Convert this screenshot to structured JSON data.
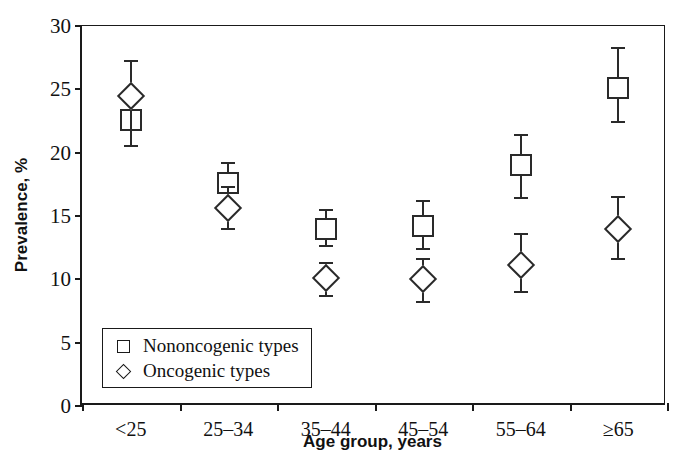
{
  "chart_data": {
    "type": "scatter",
    "title": "",
    "xlabel": "Age group, years",
    "ylabel": "Prevalence, %",
    "categories": [
      "<25",
      "25–34",
      "35–44",
      "45–54",
      "55–64",
      "≥65"
    ],
    "ylim": [
      0,
      30
    ],
    "yticks": [
      0,
      5,
      10,
      15,
      20,
      25,
      30
    ],
    "ytick_labels": [
      "0",
      "5",
      "10",
      "15",
      "20",
      "25",
      "30"
    ],
    "grid": false,
    "legend_position": "lower-left-inside",
    "series": [
      {
        "name": "Nononcogenic types",
        "marker": "open-square",
        "values": [
          22.6,
          17.6,
          14.0,
          14.2,
          19.0,
          25.1
        ],
        "ci_low": [
          20.5,
          16.1,
          12.6,
          12.4,
          16.4,
          22.4
        ],
        "ci_high": [
          27.2,
          19.2,
          15.5,
          16.2,
          21.4,
          28.3
        ]
      },
      {
        "name": "Oncogenic types",
        "marker": "open-diamond",
        "values": [
          24.5,
          15.6,
          10.1,
          10.0,
          11.1,
          14.0
        ],
        "ci_low": [
          20.5,
          14.0,
          8.7,
          8.2,
          9.0,
          11.6
        ],
        "ci_high": [
          27.2,
          17.3,
          11.3,
          11.6,
          13.6,
          16.5
        ]
      }
    ]
  },
  "legend": {
    "entries": [
      {
        "label": "Nononcogenic types",
        "marker": "open-square"
      },
      {
        "label": "Oncogenic types",
        "marker": "open-diamond"
      }
    ]
  },
  "colors": {
    "axis": "#1a1a1a",
    "marker": "#2a2a2a",
    "background": "#ffffff"
  }
}
